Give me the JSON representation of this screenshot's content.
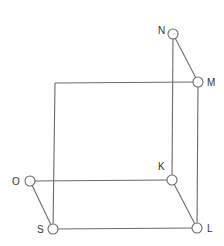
{
  "diagram": {
    "type": "cube-wireframe",
    "stroke_color": "#6b6b6b",
    "label_color": "#333333",
    "node_radius": 5,
    "nodes": [
      {
        "id": "N",
        "label": "N",
        "x": 173,
        "y": 34,
        "lx": 158,
        "ly": 34
      },
      {
        "id": "M",
        "label": "M",
        "x": 198,
        "y": 82,
        "lx": 207,
        "ly": 86
      },
      {
        "id": "K",
        "label": "K",
        "x": 172,
        "y": 180,
        "lx": 158,
        "ly": 170
      },
      {
        "id": "L",
        "label": "L",
        "x": 197,
        "y": 228,
        "lx": 207,
        "ly": 232
      },
      {
        "id": "O",
        "label": "O",
        "x": 30,
        "y": 181,
        "lx": 12,
        "ly": 185
      },
      {
        "id": "S",
        "label": "S",
        "x": 53,
        "y": 229,
        "lx": 37,
        "ly": 233
      }
    ],
    "corner_top_left": {
      "x": 55,
      "y": 83
    },
    "edges": [
      {
        "from": "N",
        "to": "M"
      },
      {
        "from": "N",
        "to": "K"
      },
      {
        "from": "O",
        "to": "K"
      },
      {
        "from": "O",
        "to": "S"
      },
      {
        "from": "K",
        "to": "L"
      },
      {
        "from": "S",
        "to": "L"
      },
      {
        "from": "M",
        "to": "L"
      },
      {
        "from": "corner_top_left",
        "to": "M"
      },
      {
        "from": "corner_top_left",
        "to": "S"
      }
    ]
  }
}
